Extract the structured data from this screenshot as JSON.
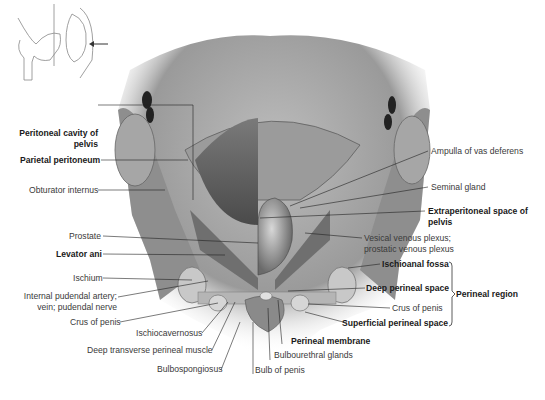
{
  "figure": {
    "orientation_sketch": {
      "icon": "sagittal-pelvis-sketch",
      "arrow": "arrow-left-icon"
    },
    "labels_left": [
      {
        "id": "peritoneal-cavity",
        "text_line1": "Peritoneal cavity of",
        "text_line2": "pelvis",
        "bold": true
      },
      {
        "id": "parietal-peritoneum",
        "text": "Parietal peritoneum",
        "bold": true
      },
      {
        "id": "obturator-internus",
        "text": "Obturator internus",
        "bold": false
      },
      {
        "id": "prostate",
        "text": "Prostate",
        "bold": false
      },
      {
        "id": "levator-ani",
        "text": "Levator ani",
        "bold": true
      },
      {
        "id": "ischium",
        "text": "Ischium",
        "bold": false
      },
      {
        "id": "internal-pudendal",
        "text_line1": "Internal pudendal artery;",
        "text_line2": "vein; pudendal nerve",
        "bold": false
      },
      {
        "id": "crus-of-penis-left",
        "text": "Crus of penis",
        "bold": false
      }
    ],
    "labels_bottom": [
      {
        "id": "ischiocavernosus",
        "text": "Ischiocavernosus",
        "bold": false
      },
      {
        "id": "deep-transverse-perineal-muscle",
        "text": "Deep transverse perineal muscle",
        "bold": false
      },
      {
        "id": "bulbospongiosus",
        "text": "Bulbospongiosus",
        "bold": false
      },
      {
        "id": "bulb-of-penis",
        "text": "Bulb of penis",
        "bold": false
      },
      {
        "id": "bulbourethral-glands",
        "text": "Bulbourethral glands",
        "bold": false
      },
      {
        "id": "perineal-membrane",
        "text": "Perineal membrane",
        "bold": true
      }
    ],
    "labels_right": [
      {
        "id": "ampulla-of-vas-deferens",
        "text": "Ampulla of vas deferens",
        "bold": false
      },
      {
        "id": "seminal-gland",
        "text": "Seminal gland",
        "bold": false
      },
      {
        "id": "extraperitoneal-space",
        "text_line1": "Extraperitoneal space of",
        "text_line2": "pelvis",
        "bold": true
      },
      {
        "id": "vesical-venous-plexus",
        "text_line1": "Vesical venous plexus;",
        "text_line2": "prostatic venous plexus",
        "bold": false
      },
      {
        "id": "ischioanal-fossa",
        "text": "Ischioanal fossa",
        "bold": true
      },
      {
        "id": "deep-perineal-space",
        "text": "Deep perineal space",
        "bold": true
      },
      {
        "id": "crus-of-penis-right",
        "text": "Crus of penis",
        "bold": false
      },
      {
        "id": "superficial-perineal-space",
        "text": "Superficial perineal space",
        "bold": true
      }
    ],
    "bracket_group": {
      "text": "Perineal region",
      "bold": true
    }
  }
}
